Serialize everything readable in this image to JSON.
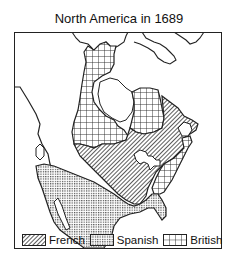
{
  "title": "North America in 1689",
  "legend": [
    {
      "label": "French",
      "pattern": "diagonal-hatch"
    },
    {
      "label": "Spanish",
      "pattern": "fine-dots"
    },
    {
      "label": "British",
      "pattern": "grid"
    }
  ],
  "colors": {
    "outline": "#222222",
    "background": "#ffffff"
  }
}
